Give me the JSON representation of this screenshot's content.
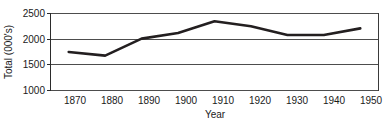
{
  "chart_data": {
    "type": "line",
    "title": "",
    "xlabel": "Year",
    "ylabel": "Total (000's)",
    "categories": [
      "1870",
      "1880",
      "1890",
      "1900",
      "1910",
      "1920",
      "1930",
      "1940",
      "1950"
    ],
    "x": [
      1870,
      1880,
      1890,
      1900,
      1910,
      1920,
      1930,
      1940,
      1950
    ],
    "values": [
      1750,
      1680,
      2010,
      2120,
      2350,
      2250,
      2080,
      2080,
      2210
    ],
    "series": [
      {
        "name": "Total",
        "values": [
          1750,
          1680,
          2010,
          2120,
          2350,
          2250,
          2080,
          2080,
          2210
        ]
      }
    ],
    "ylim": [
      1000,
      2500
    ],
    "xlim": [
      1865,
      1955
    ],
    "ytick_labels": [
      "1000",
      "1500",
      "2000",
      "2500"
    ],
    "yticks": [
      1000,
      1500,
      2000,
      2500
    ],
    "xtick_labels": [
      "1870",
      "1880",
      "1890",
      "1900",
      "1910",
      "1920",
      "1930",
      "1940",
      "1950"
    ],
    "grid": true,
    "grid_axis": "y",
    "legend": false,
    "legend_position": "none",
    "line_color": "#231f20",
    "grid_color": "#4d4d4d",
    "background_color": "#ffffff"
  },
  "axes": {
    "y_title": "Total (000's)",
    "x_title": "Year",
    "y_tick_0": "1000",
    "y_tick_1": "1500",
    "y_tick_2": "2000",
    "y_tick_3": "2500",
    "x_tick_0": "1870",
    "x_tick_1": "1880",
    "x_tick_2": "1890",
    "x_tick_3": "1900",
    "x_tick_4": "1910",
    "x_tick_5": "1920",
    "x_tick_6": "1930",
    "x_tick_7": "1940",
    "x_tick_8": "1950"
  }
}
